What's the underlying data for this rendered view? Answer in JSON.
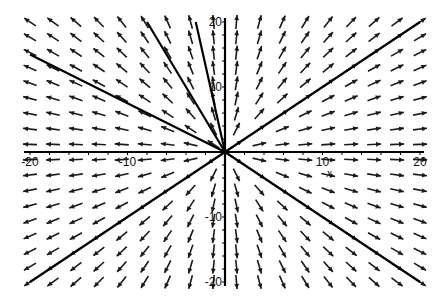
{
  "chart_data": {
    "type": "direction_field",
    "title": "",
    "xlabel": "x",
    "ylabel": "",
    "xlim": [
      -20,
      20
    ],
    "ylim": [
      -20,
      20
    ],
    "grid": false,
    "legend": null,
    "x_ticks": [
      {
        "value": -20,
        "label": "-20"
      },
      {
        "value": -10,
        "label": "-10"
      },
      {
        "value": 10,
        "label": "10"
      },
      {
        "value": 20,
        "label": "20"
      }
    ],
    "y_ticks": [
      {
        "value": 20,
        "label": "20"
      },
      {
        "value": 10,
        "label": "10"
      },
      {
        "value": -10,
        "label": "-10"
      },
      {
        "value": -20,
        "label": "-20"
      }
    ],
    "arrow_grid": {
      "columns": 18,
      "rows": 18,
      "description": "Arrows point radially away from the origin (unstable node / source)"
    },
    "solution_lines": [
      {
        "slope": -0.75,
        "from": [
          -20,
          15
        ],
        "to": [
          0,
          0
        ]
      },
      {
        "slope": -2.5,
        "from": [
          -8,
          20
        ],
        "to": [
          0,
          0
        ]
      },
      {
        "slope": -1.0,
        "from": [
          0,
          0
        ],
        "to": [
          20,
          -20
        ]
      },
      {
        "slope": 1.0,
        "from": [
          -20,
          -20
        ],
        "to": [
          20,
          20
        ]
      },
      {
        "slope": 3.5,
        "from": [
          -3,
          20
        ],
        "to": [
          0,
          0
        ]
      }
    ],
    "colors": {
      "arrows": "#1a1a1a",
      "axes": "#000000",
      "lines": "#000000",
      "background": "#ffffff"
    }
  }
}
